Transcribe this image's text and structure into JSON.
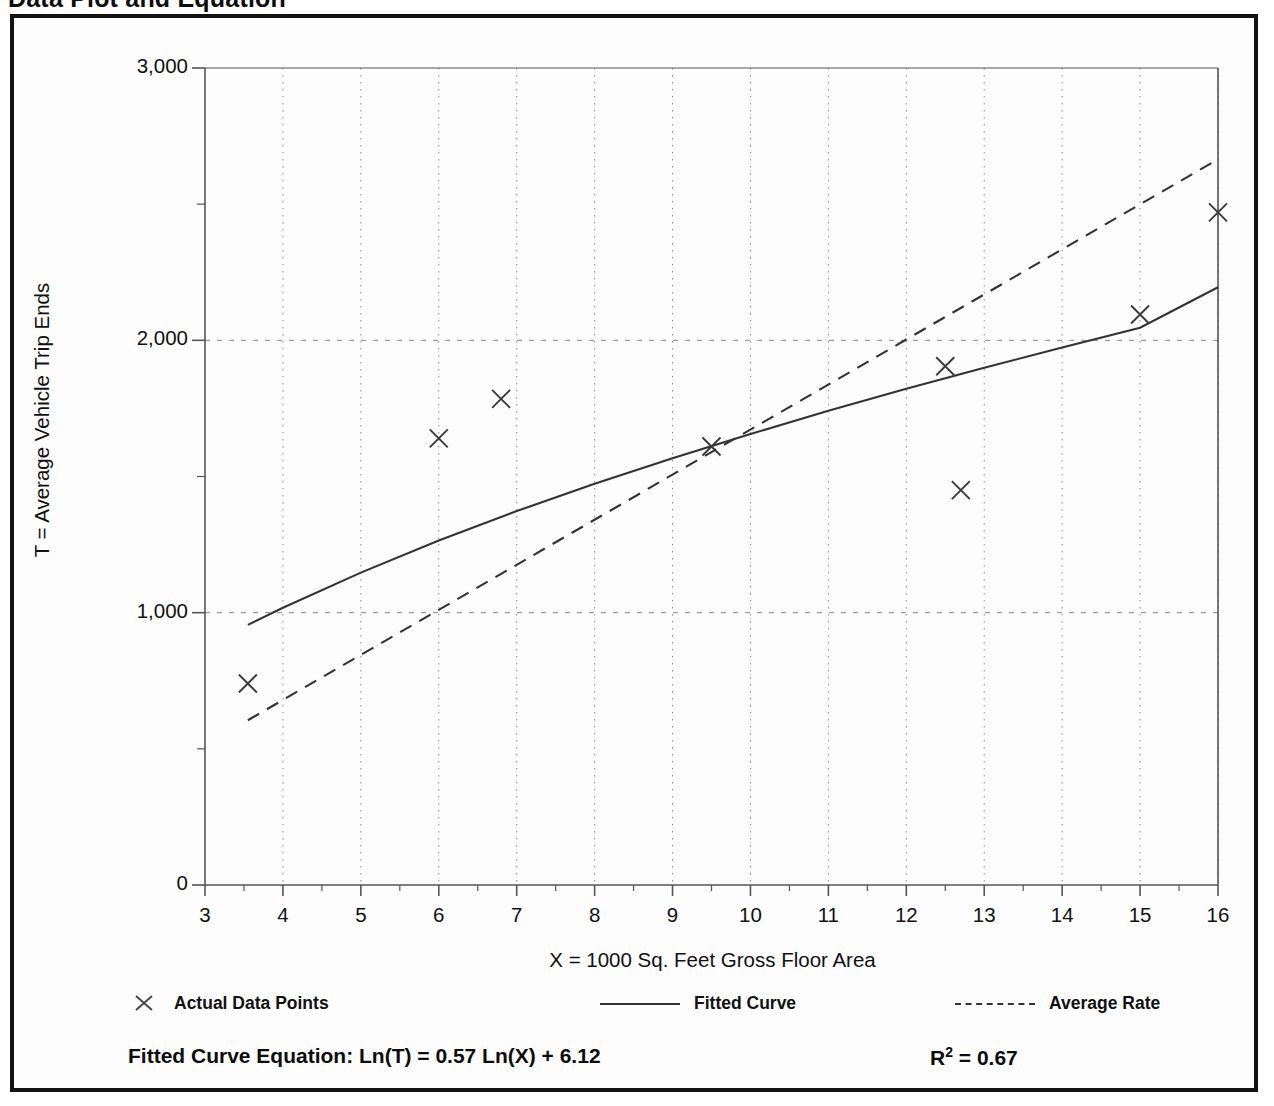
{
  "page": {
    "title": "Data Plot and Equation"
  },
  "legend": {
    "items": [
      {
        "label": "Actual Data Points",
        "marker": "x-marker",
        "style": "marker"
      },
      {
        "label": "Fitted Curve",
        "marker": "solid-line",
        "style": "solid"
      },
      {
        "label": "Average Rate",
        "marker": "dashed-line",
        "style": "dashed"
      }
    ]
  },
  "equation": {
    "fitted_curve": "Fitted Curve Equation:  Ln(T) = 0.57 Ln(X) + 6.12",
    "r_squared_symbol": "R",
    "r_squared_exponent": "2",
    "r_squared_value": " = 0.67"
  },
  "colors": {
    "frame": "#131313",
    "axis": "#555555",
    "grid": "#888888",
    "series": "#333333",
    "text": "#111111"
  },
  "chart_data": {
    "type": "scatter",
    "title": "Data Plot and Equation",
    "xlabel": "X = 1000 Sq. Feet Gross Floor Area",
    "ylabel": "T = Average Vehicle Trip Ends",
    "xlim": [
      3,
      16
    ],
    "ylim": [
      0,
      3000
    ],
    "grid": true,
    "x_major_ticks": [
      3,
      4,
      5,
      6,
      7,
      8,
      9,
      10,
      11,
      12,
      13,
      14,
      15,
      16
    ],
    "x_tick_labels": [
      "3",
      "4",
      "5",
      "6",
      "7",
      "8",
      "9",
      "10",
      "11",
      "12",
      "13",
      "14",
      "15",
      "16"
    ],
    "x_minor_ticks": [
      3.5,
      4.5,
      5.5,
      6.5,
      7.5,
      8.5,
      9.5,
      10.5,
      11.5,
      12.5,
      13.5,
      14.5,
      15.5
    ],
    "y_major_ticks": [
      0,
      1000,
      2000,
      3000
    ],
    "y_tick_labels": [
      "0",
      "1,000",
      "2,000",
      "3,000"
    ],
    "y_minor_ticks": [
      500,
      1500,
      2500
    ],
    "legend_position": "below-axes",
    "annotations": [
      "Fitted Curve Equation:  Ln(T) = 0.57 Ln(X) + 6.12",
      "R2 = 0.67"
    ],
    "series": [
      {
        "name": "Actual Data Points",
        "type": "scatter",
        "marker": "x",
        "points": [
          {
            "x": 3.55,
            "y": 740
          },
          {
            "x": 6.0,
            "y": 1640
          },
          {
            "x": 6.8,
            "y": 1785
          },
          {
            "x": 9.5,
            "y": 1610
          },
          {
            "x": 12.5,
            "y": 1905
          },
          {
            "x": 12.7,
            "y": 1450
          },
          {
            "x": 15.0,
            "y": 2095
          },
          {
            "x": 16.0,
            "y": 2470
          }
        ]
      },
      {
        "name": "Fitted Curve",
        "type": "line",
        "style": "solid",
        "equation": "Ln(T) = 0.57 Ln(X) + 6.12",
        "points": [
          {
            "x": 3.55,
            "y": 955
          },
          {
            "x": 4.0,
            "y": 1018
          },
          {
            "x": 5.0,
            "y": 1147
          },
          {
            "x": 6.0,
            "y": 1265
          },
          {
            "x": 7.0,
            "y": 1373
          },
          {
            "x": 8.0,
            "y": 1473
          },
          {
            "x": 9.0,
            "y": 1567
          },
          {
            "x": 10.0,
            "y": 1656
          },
          {
            "x": 11.0,
            "y": 1741
          },
          {
            "x": 12.0,
            "y": 1822
          },
          {
            "x": 13.0,
            "y": 1899
          },
          {
            "x": 14.0,
            "y": 1974
          },
          {
            "x": 15.0,
            "y": 2046
          },
          {
            "x": 16.0,
            "y": 2195
          }
        ]
      },
      {
        "name": "Average Rate",
        "type": "line",
        "style": "dashed",
        "points": [
          {
            "x": 3.55,
            "y": 605
          },
          {
            "x": 16.0,
            "y": 2665
          }
        ]
      }
    ]
  }
}
